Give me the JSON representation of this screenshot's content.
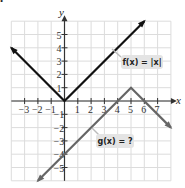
{
  "chart_data": {
    "type": "line",
    "title": "",
    "xlabel": "x",
    "ylabel": "y",
    "xlim": [
      -4,
      8
    ],
    "ylim": [
      -6,
      6
    ],
    "grid": true,
    "x_tick_labels": [
      "-3",
      "-2",
      "-1",
      "1",
      "2",
      "3",
      "4",
      "5",
      "6",
      "7"
    ],
    "y_tick_labels": [
      "5",
      "4",
      "3",
      "2",
      "1",
      "-1",
      "-2",
      "-3",
      "-4",
      "-5"
    ],
    "series": [
      {
        "name": "f(x) = |x|",
        "color": "#111111",
        "points": [
          [
            -4,
            4
          ],
          [
            0,
            0
          ],
          [
            6,
            6
          ]
        ]
      },
      {
        "name": "g(x) = ?",
        "color": "#666666",
        "points": [
          [
            -2,
            -6
          ],
          [
            5,
            1
          ],
          [
            8,
            -2
          ]
        ]
      }
    ],
    "annotations": [
      {
        "text": "f(x) = |x|",
        "anchor": [
          4,
          4
        ]
      },
      {
        "text": "g(x) = ?",
        "anchor": [
          3,
          -3
        ]
      }
    ]
  },
  "labels": {
    "x_axis": "x",
    "y_axis": "y",
    "f_label": "f(x) = |x|",
    "g_label": "g(x) = ?",
    "bullet": "•"
  }
}
